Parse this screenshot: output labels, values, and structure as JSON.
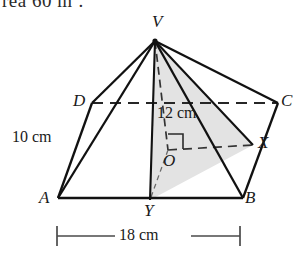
{
  "page": {
    "clipped_text_top": "rea 60 m",
    "clipped_text_sup": "2",
    "clipped_text_tail": "."
  },
  "figure": {
    "type": "square-based-pyramid",
    "vertex_labels": {
      "apex": "V",
      "base_front_left": "A",
      "base_front_right": "B",
      "base_back_right": "C",
      "base_back_left": "D",
      "centre": "O",
      "midpoint_ab": "Y",
      "midpoint_bc": "X"
    },
    "measurements": {
      "height": "12 cm",
      "slant_edge": "10 cm",
      "base_width": "18 cm"
    },
    "colors": {
      "stroke": "#1a1a1a",
      "shade_fill": "#e2e2e2",
      "dash_stroke": "#333333",
      "dim_stroke": "#555555"
    },
    "points": {
      "V": [
        155,
        41
      ],
      "A": [
        58,
        198
      ],
      "B": [
        243,
        198
      ],
      "C": [
        278,
        103
      ],
      "D": [
        92,
        103
      ],
      "O": [
        168,
        150
      ],
      "X": [
        253,
        145
      ],
      "Y": [
        150,
        200
      ]
    }
  },
  "annotations": {
    "height_label": "12 cm",
    "slant_label": "10 cm",
    "base_label": "18 cm",
    "right_angle": "right-angle-marker-at-O"
  }
}
